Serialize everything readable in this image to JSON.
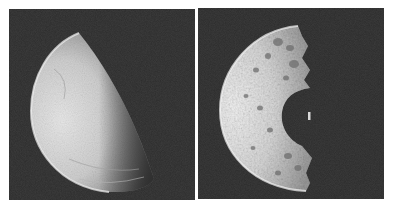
{
  "figure": {
    "panels": [
      {
        "id": "left",
        "subject": "smooth-moon-half-lit",
        "background_color": "#2a2a2a",
        "surface_color_light": "#e4e4e4",
        "surface_color_dark": "#6a6a6a"
      },
      {
        "id": "right",
        "subject": "cratered-moon-half-lit-with-large-crater",
        "background_color": "#2a2a2a",
        "surface_color_light": "#ededed",
        "surface_color_dark": "#8a8a8a"
      }
    ]
  }
}
